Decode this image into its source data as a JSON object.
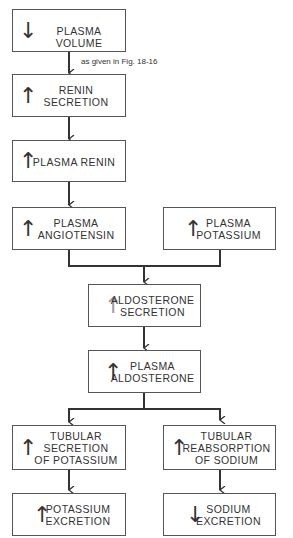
{
  "annotation": "as given in Fig. 18-16",
  "nodes": [
    {
      "id": "plasma-volume",
      "direction": "down",
      "lines": [
        "PLASMA VOLUME"
      ]
    },
    {
      "id": "renin-secretion",
      "direction": "up",
      "lines": [
        "RENIN",
        "SECRETION"
      ]
    },
    {
      "id": "plasma-renin",
      "direction": "up",
      "lines": [
        "PLASMA RENIN"
      ]
    },
    {
      "id": "plasma-angiotensin",
      "direction": "up",
      "lines": [
        "PLASMA",
        "ANGIOTENSIN"
      ]
    },
    {
      "id": "plasma-potassium",
      "direction": "up",
      "lines": [
        "PLASMA",
        "POTASSIUM"
      ]
    },
    {
      "id": "aldosterone-secretion",
      "direction": "up",
      "lines": [
        "ALDOSTERONE",
        "SECRETION"
      ]
    },
    {
      "id": "plasma-aldosterone",
      "direction": "up",
      "lines": [
        "PLASMA",
        "ALDOSTERONE"
      ]
    },
    {
      "id": "tubular-secretion-potassium",
      "direction": "up",
      "lines": [
        "TUBULAR",
        "SECRETION",
        "OF POTASSIUM"
      ]
    },
    {
      "id": "tubular-reabsorption-sodium",
      "direction": "up",
      "lines": [
        "TUBULAR",
        "REABSORPTION",
        "OF SODIUM"
      ]
    },
    {
      "id": "potassium-excretion",
      "direction": "up",
      "lines": [
        "POTASSIUM",
        "EXCRETION"
      ]
    },
    {
      "id": "sodium-excretion",
      "direction": "down",
      "lines": [
        "SODIUM",
        "EXCRETION"
      ]
    }
  ],
  "arrows": {
    "up": "↑",
    "down": "↓"
  }
}
